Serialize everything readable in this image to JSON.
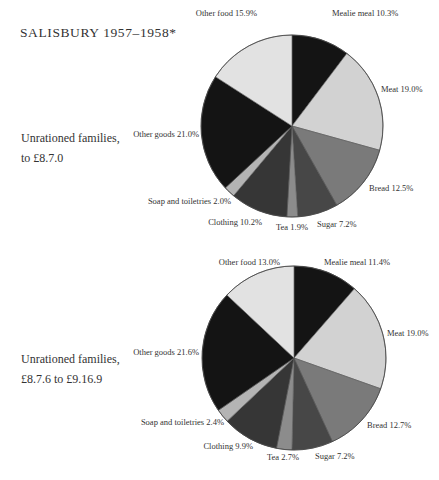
{
  "title": "SALISBURY 1957–1958*",
  "chart_data": [
    {
      "type": "pie",
      "title": "Unrationed families, to £8.7.0",
      "group_label_lines": [
        "Unrationed families,",
        "to £8.7.0"
      ],
      "start_angle_deg": 0,
      "direction": "clockwise",
      "center": [
        292,
        126
      ],
      "radius": 91,
      "slices": [
        {
          "label": "Mealie meal",
          "value": 10.3,
          "color": "#141414",
          "text": "Mealie meal 10.3%",
          "lx": 332,
          "ly": 16,
          "anchor": "start"
        },
        {
          "label": "Meat",
          "value": 19.0,
          "color": "#d2d2d2",
          "text": "Meat 19.0%",
          "lx": 381,
          "ly": 92,
          "anchor": "start"
        },
        {
          "label": "Bread",
          "value": 12.5,
          "color": "#7a7a7a",
          "text": "Bread 12.5%",
          "lx": 369,
          "ly": 191,
          "anchor": "start"
        },
        {
          "label": "Sugar",
          "value": 7.2,
          "color": "#474747",
          "text": "Sugar 7.2%",
          "lx": 317,
          "ly": 227,
          "anchor": "start"
        },
        {
          "label": "Tea",
          "value": 1.9,
          "color": "#8c8c8c",
          "text": "Tea 1.9%",
          "lx": 276,
          "ly": 230,
          "anchor": "start"
        },
        {
          "label": "Clothing",
          "value": 10.2,
          "color": "#363636",
          "text": "Clothing 10.2%",
          "lx": 262,
          "ly": 225,
          "anchor": "end"
        },
        {
          "label": "Soap and toiletries",
          "value": 2.0,
          "color": "#b4b4b4",
          "text": "Soap and toiletries 2.0%",
          "lx": 231,
          "ly": 204,
          "anchor": "end"
        },
        {
          "label": "Other goods",
          "value": 21.0,
          "color": "#141414",
          "text": "Other goods 21.0%",
          "lx": 199,
          "ly": 137,
          "anchor": "end"
        },
        {
          "label": "Other food",
          "value": 15.9,
          "color": "#e2e2e2",
          "text": "Other food 15.9%",
          "lx": 257,
          "ly": 16,
          "anchor": "end"
        }
      ]
    },
    {
      "type": "pie",
      "title": "Unrationed families, £8.7.6 to £9.16.9",
      "group_label_lines": [
        "Unrationed families,",
        "£8.7.6 to £9.16.9"
      ],
      "start_angle_deg": 0,
      "direction": "clockwise",
      "center": [
        294,
        358
      ],
      "radius": 92,
      "slices": [
        {
          "label": "Mealie meal",
          "value": 11.4,
          "color": "#141414",
          "text": "Mealie meal 11.4%",
          "lx": 324,
          "ly": 265,
          "anchor": "start"
        },
        {
          "label": "Meat",
          "value": 19.0,
          "color": "#d2d2d2",
          "text": "Meat 19.0%",
          "lx": 387,
          "ly": 336,
          "anchor": "start"
        },
        {
          "label": "Bread",
          "value": 12.7,
          "color": "#7a7a7a",
          "text": "Bread 12.7%",
          "lx": 367,
          "ly": 428,
          "anchor": "start"
        },
        {
          "label": "Sugar",
          "value": 7.2,
          "color": "#474747",
          "text": "Sugar 7.2%",
          "lx": 315,
          "ly": 459,
          "anchor": "start"
        },
        {
          "label": "Tea",
          "value": 2.7,
          "color": "#8c8c8c",
          "text": "Tea 2.7%",
          "lx": 267,
          "ly": 460,
          "anchor": "start"
        },
        {
          "label": "Clothing",
          "value": 9.9,
          "color": "#363636",
          "text": "Clothing 9.9%",
          "lx": 253,
          "ly": 449,
          "anchor": "end"
        },
        {
          "label": "Soap and toiletries",
          "value": 2.4,
          "color": "#b4b4b4",
          "text": "Soap and toiletries 2.4%",
          "lx": 224,
          "ly": 425,
          "anchor": "end"
        },
        {
          "label": "Other goods",
          "value": 21.6,
          "color": "#141414",
          "text": "Other goods 21.6%",
          "lx": 199,
          "ly": 355,
          "anchor": "end"
        },
        {
          "label": "Other food",
          "value": 13.0,
          "color": "#e2e2e2",
          "text": "Other food 13.0%",
          "lx": 280,
          "ly": 265,
          "anchor": "end"
        }
      ]
    }
  ]
}
